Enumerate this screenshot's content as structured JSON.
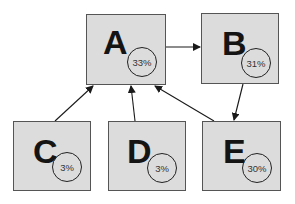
{
  "nodes": [
    {
      "id": "A",
      "label": "A",
      "value": "33%"
    },
    {
      "id": "B",
      "label": "B",
      "value": "31%"
    },
    {
      "id": "C",
      "label": "C",
      "value": "3%"
    },
    {
      "id": "D",
      "label": "D",
      "value": "3%"
    },
    {
      "id": "E",
      "label": "E",
      "value": "30%"
    }
  ],
  "edges": [
    {
      "from": "C",
      "to": "A"
    },
    {
      "from": "D",
      "to": "A"
    },
    {
      "from": "E",
      "to": "A"
    },
    {
      "from": "A",
      "to": "B"
    },
    {
      "from": "B",
      "to": "E"
    }
  ],
  "colors": {
    "node_fill": "#dcdcdc",
    "node_border": "#555555",
    "edge": "#1a1a1a"
  }
}
